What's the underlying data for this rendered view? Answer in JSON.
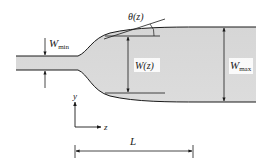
{
  "diagram": {
    "labels": {
      "theta": "θ(z)",
      "w_min_main": "W",
      "w_min_sub": "min",
      "w_z": "W(z)",
      "w_max_main": "W",
      "w_max_sub": "max",
      "axis_y": "y",
      "axis_z": "z",
      "length": "L"
    },
    "colors": {
      "fill": "#d9d9d9",
      "stroke": "#1a1a1a",
      "background": "#ffffff"
    }
  }
}
